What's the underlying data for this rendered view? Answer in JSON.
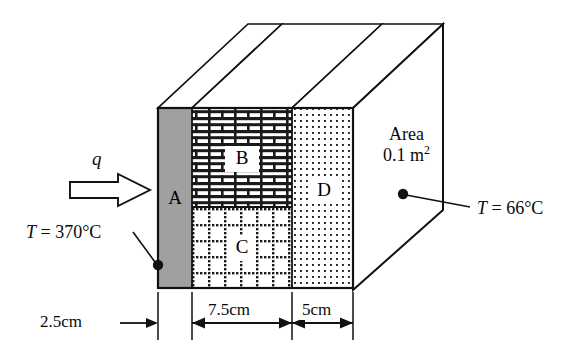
{
  "figure": {
    "name": "composite-wall-heat-conduction-diagram"
  },
  "heat_flux": {
    "symbol": "q",
    "arrow_direction": "right"
  },
  "layers": [
    {
      "id": "A",
      "label": "A",
      "pattern": "solid-gray",
      "thickness_label": "2.5cm"
    },
    {
      "id": "B",
      "label": "B",
      "pattern": "brick",
      "thickness_label": "7.5cm"
    },
    {
      "id": "C",
      "label": "C",
      "pattern": "dashed-grid",
      "thickness_label": "7.5cm"
    },
    {
      "id": "D",
      "label": "D",
      "pattern": "fine-dots",
      "thickness_label": "5cm"
    }
  ],
  "dimensions": [
    {
      "id": "dim-a",
      "label": "2.5cm",
      "style": "single-arrow-right"
    },
    {
      "id": "dim-bc",
      "label": "7.5cm",
      "style": "double-arrow"
    },
    {
      "id": "dim-d",
      "label": "5cm",
      "style": "double-arrow"
    }
  ],
  "annotations": {
    "hot_face": {
      "prefix": "T",
      "equals": "=",
      "value": "370°C",
      "full": "T = 370°C"
    },
    "cold_face": {
      "prefix": "T",
      "equals": "=",
      "value": "66°C",
      "full": "T = 66°C"
    },
    "area": {
      "line1": "Area",
      "value": "0.1",
      "unit": "m",
      "exponent": "2"
    }
  },
  "colors": {
    "outline": "#111111",
    "layer_a_fill": "#a0a0a0",
    "hatch_ink": "#1a1a1a",
    "background": "#ffffff"
  }
}
